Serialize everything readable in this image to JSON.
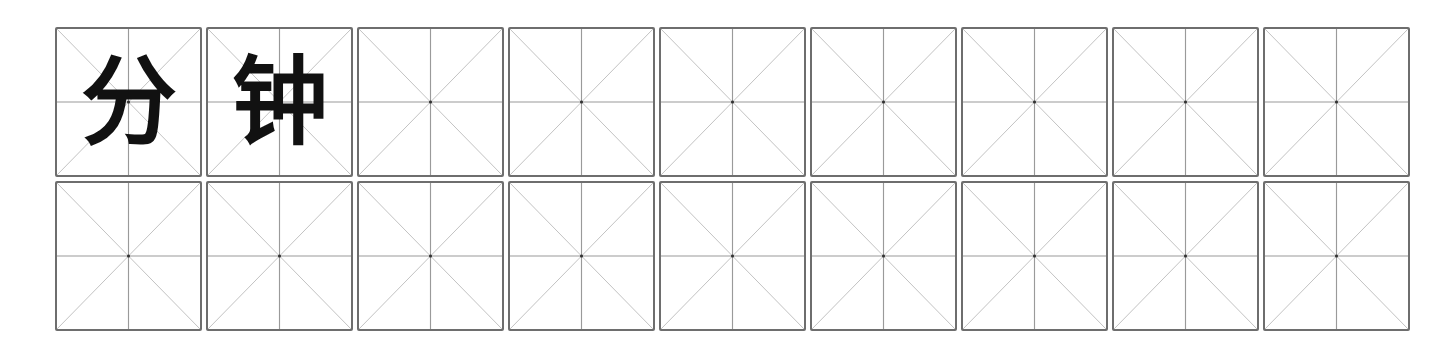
{
  "worksheet": {
    "grid_type": "mi-zi-ge",
    "columns": 9,
    "rows": [
      {
        "cells": [
          "分",
          "钟",
          "",
          "",
          "",
          "",
          "",
          "",
          ""
        ]
      },
      {
        "cells": [
          "",
          "",
          "",
          "",
          "",
          "",
          "",
          "",
          ""
        ]
      }
    ],
    "colors": {
      "border": "#6e6e6e",
      "guide_lines": "#9a9a9a",
      "diagonals": "#b8b8b8",
      "character": "#111111"
    }
  }
}
